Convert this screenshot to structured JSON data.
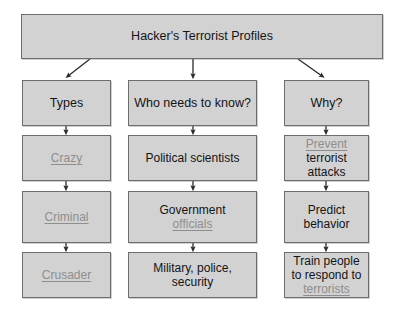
{
  "diagram": {
    "title_box": {
      "label": "Hacker's Terrorist Profiles"
    },
    "columns": [
      {
        "id": "types",
        "head_label": "Types",
        "nodes": [
          {
            "id": "crazy",
            "text_gray": "Crazy",
            "text_black": ""
          },
          {
            "id": "criminal",
            "text_gray": "Criminal",
            "text_black": ""
          },
          {
            "id": "crusader",
            "text_gray": "Crusader",
            "text_black": ""
          }
        ]
      },
      {
        "id": "who-needs-to-know",
        "head_label": "Who needs to know?",
        "nodes": [
          {
            "id": "political-scientists",
            "text_gray": "",
            "text_black": "Political scientists"
          },
          {
            "id": "government-officials",
            "text_gray": "officials",
            "text_black": "Government"
          },
          {
            "id": "military-police-security",
            "text_gray": "",
            "text_black": "Military, police, security"
          }
        ]
      },
      {
        "id": "why",
        "head_label": "Why?",
        "nodes": [
          {
            "id": "prevent-terrorist-attacks",
            "text_gray": "Prevent",
            "text_black": "terrorist attacks"
          },
          {
            "id": "predict-behavior",
            "text_gray": "",
            "text_black": "Predict behavior"
          },
          {
            "id": "train-people-to-respond",
            "text_gray": "terrorists",
            "text_black": "Train people to respond to"
          }
        ]
      }
    ],
    "colors": {
      "box_fill": "#d2d2d2",
      "box_border": "#6d6d6d",
      "text": "#141414",
      "highlight_text": "#8e8e8e",
      "arrow": "#2a2a2a",
      "background": "#ffffff"
    }
  }
}
